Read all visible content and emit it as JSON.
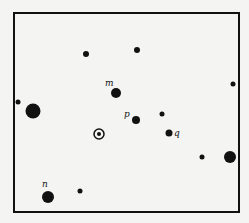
{
  "diagram": {
    "frame": {
      "x": 14,
      "y": 13,
      "width": 225,
      "height": 199,
      "stroke": "#111111"
    },
    "ink_color": "#111111",
    "background": "#f4f4f2",
    "points": [
      {
        "id": "dot-1",
        "x": 86,
        "y": 54,
        "r": 3
      },
      {
        "id": "dot-2",
        "x": 137,
        "y": 50,
        "r": 3
      },
      {
        "id": "dot-m",
        "x": 116,
        "y": 93,
        "r": 5,
        "label": "m",
        "lx": 105,
        "ly": 86
      },
      {
        "id": "dot-3",
        "x": 233,
        "y": 84,
        "r": 2.5
      },
      {
        "id": "dot-4",
        "x": 18,
        "y": 102,
        "r": 2.5
      },
      {
        "id": "dot-5",
        "x": 33,
        "y": 111,
        "r": 7.5
      },
      {
        "id": "dot-p",
        "x": 136,
        "y": 120,
        "r": 4,
        "label": "p",
        "lx": 124,
        "ly": 117
      },
      {
        "id": "dot-6",
        "x": 162,
        "y": 114,
        "r": 2.5
      },
      {
        "id": "dot-q",
        "x": 169,
        "y": 133,
        "r": 3.5,
        "label": "q",
        "lx": 174,
        "ly": 136
      },
      {
        "id": "dot-7",
        "x": 202,
        "y": 157,
        "r": 2.5
      },
      {
        "id": "dot-8",
        "x": 230,
        "y": 157,
        "r": 6
      },
      {
        "id": "dot-n",
        "x": 48,
        "y": 197,
        "r": 6,
        "label": "n",
        "lx": 42,
        "ly": 187
      },
      {
        "id": "dot-9",
        "x": 80,
        "y": 191,
        "r": 2.5
      }
    ],
    "center_marker": {
      "x": 99,
      "y": 134,
      "outer_r": 5,
      "inner_r": 2
    }
  }
}
